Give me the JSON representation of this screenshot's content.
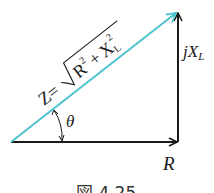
{
  "diagram": {
    "type": "impedance-triangle",
    "colors": {
      "axis": "#1a1a1a",
      "hypotenuse": "#4cc3cf"
    },
    "labels": {
      "horizontal": "R",
      "vertical_j": "j",
      "vertical_x": "X",
      "vertical_sub": "L",
      "angle": "θ",
      "hyp_z": "Z",
      "hyp_eq": "=",
      "hyp_r": "R",
      "hyp_r_exp": "2",
      "hyp_plus": "+",
      "hyp_x": "X",
      "hyp_x_sub": "L",
      "hyp_x_exp": "2"
    },
    "caption": "図 4.25"
  }
}
